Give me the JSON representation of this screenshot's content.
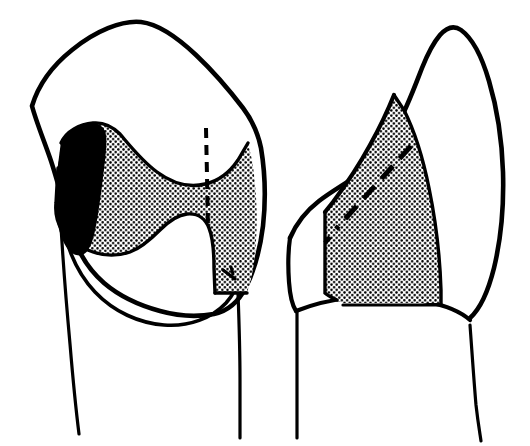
{
  "figure": {
    "title": "Tooth preparation outline diagram",
    "type": "line-art-anatomical-illustration",
    "background_color": "#ffffff",
    "ink_color": "#000000",
    "stipple_color": "#000000",
    "canvas": {
      "width": 530,
      "height": 446
    },
    "text_labels": [],
    "panels": [
      {
        "id": "left-panel",
        "name": "proximal-occlusal-view",
        "description": "Crown viewed from the proximal/occlusal aspect with a bow-tie shaped stippled preparation outline, a solid black elongated oval at its mesial margin, a vertical dashed internal line, and two diverging root outlines below.",
        "crown_outline_stroke": 4.5,
        "root_stroke": 3,
        "features": [
          {
            "name": "crown-outline",
            "fill": "none"
          },
          {
            "name": "stipple-preparation-area",
            "fill": "stipple"
          },
          {
            "name": "solid-black-box-region",
            "fill": "#000000"
          },
          {
            "name": "vertical-dashed-line",
            "dash": "9 7"
          },
          {
            "name": "cervical-line"
          },
          {
            "name": "root-left"
          },
          {
            "name": "root-right"
          }
        ]
      },
      {
        "id": "right-panel",
        "name": "buccal-lingual-view",
        "description": "Crown viewed from the side showing a pointed cusp, a stippled quadrilateral preparation area bounded by the cusp slope and the cervical line, crossed by a long diagonal dashed line, with two roots below.",
        "crown_outline_stroke": 4.5,
        "root_stroke": 3,
        "features": [
          {
            "name": "crown-outline",
            "fill": "none"
          },
          {
            "name": "stipple-preparation-area",
            "fill": "stipple"
          },
          {
            "name": "diagonal-dashed-line",
            "dash": "16 9"
          },
          {
            "name": "cervical-line"
          },
          {
            "name": "root-left"
          },
          {
            "name": "root-right"
          }
        ]
      }
    ],
    "stipple_pattern": {
      "name": "dot-grid",
      "dot_radius": 1.25,
      "spacing": 5.2,
      "color": "#000000"
    }
  }
}
